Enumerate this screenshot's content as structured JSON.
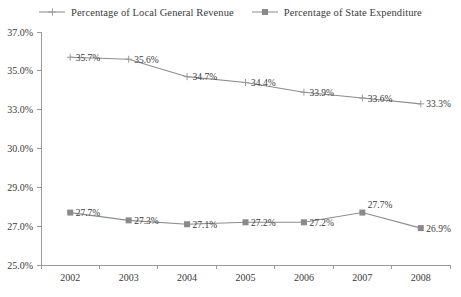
{
  "chart_data": {
    "type": "line",
    "title": "",
    "subtitle": "",
    "xlabel": "",
    "ylabel": "",
    "categories": [
      "2002",
      "2003",
      "2004",
      "2005",
      "2006",
      "2007",
      "2008"
    ],
    "ytick_labels": [
      "37.0%",
      "35.0%",
      "33.0%",
      "30.0%",
      "29.0%",
      "27.0%",
      "25.0%"
    ],
    "ytick_values": [
      37.0,
      35.0,
      33.0,
      31.0,
      29.0,
      27.0,
      25.0
    ],
    "ylim": [
      25.0,
      37.0
    ],
    "grid": false,
    "legend_position": "top-center",
    "series": [
      {
        "name": "Percentage of Local General Revenue",
        "marker": "cross",
        "color": "#8d8d8d",
        "values": [
          35.7,
          35.6,
          34.7,
          34.4,
          33.9,
          33.6,
          33.3
        ],
        "data_labels": [
          "35.7%",
          "35.6%",
          "34.7%",
          "34.4%",
          "33.9%",
          "33.6%",
          "33.3%"
        ]
      },
      {
        "name": "Percentage of State Expenditure",
        "marker": "square",
        "color": "#8a8a8a",
        "values": [
          27.7,
          27.3,
          27.1,
          27.2,
          27.2,
          27.7,
          26.9
        ],
        "data_labels": [
          "27.7%",
          "27.3%",
          "27.1%",
          "27.2%",
          "27.2%",
          "27.7%",
          "26.9%"
        ]
      }
    ]
  },
  "legend": {
    "entries": [
      {
        "label": "Percentage of Local General Revenue",
        "marker": "cross-marker"
      },
      {
        "label": "Percentage of State Expenditure",
        "marker": "square-marker"
      }
    ]
  },
  "colors": {
    "series_gray": "#8d8d8d",
    "axis_gray": "#9a9a9a",
    "text": "#3a3a3a",
    "background": "#ffffff"
  }
}
